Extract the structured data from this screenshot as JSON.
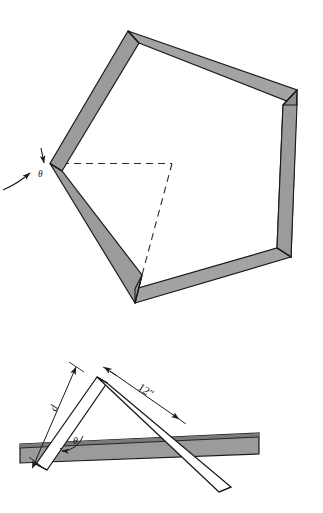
{
  "figure": {
    "colors": {
      "face_gray": "#9b9b9b",
      "face_gray_light": "#a8a8a8",
      "face_gray_dark": "#6f6f6f",
      "outline": "#1a1a1a",
      "white": "#ffffff",
      "background": "#ffffff",
      "dashed": "#2b2b2b"
    }
  },
  "top_figure": {
    "name": "pentagon-frame",
    "description": "Pentagonal picture frame built from five mitered strips, viewed in perspective",
    "angle_label": "θ",
    "leader_note": "curved leader arrow pointing at the miter joint at the left vertex",
    "dashed_construction": "two dashed lines from the left vertex marking the interior angle"
  },
  "bottom_figure": {
    "name": "miter-detail",
    "description": "Two strips meeting at an apex above a horizontal base bar",
    "angle_label": "θ",
    "length_label": "d",
    "dimension_label": "12″"
  },
  "labels": {
    "theta_top": "θ",
    "theta_bottom": "θ",
    "d": "d",
    "twelve_inch": "12″"
  }
}
